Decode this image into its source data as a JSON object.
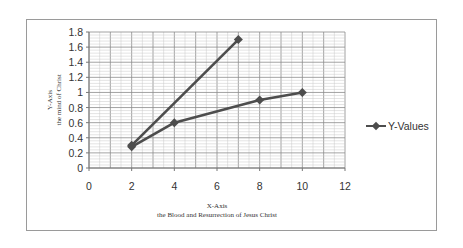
{
  "chart_data": {
    "type": "scatter",
    "title": "",
    "xlabel": "X-Axis\nthe Blood and Resurrection of Jesus Christ",
    "xlabel_lines": [
      "X-Axis",
      "the Blood and Resurrection of Jesus Christ"
    ],
    "ylabel": "Y-Axis\nthe mind of Christ",
    "ylabel_lines": [
      "Y-Axis",
      "the mind of Christ"
    ],
    "xlim": [
      0,
      12
    ],
    "ylim": [
      0,
      1.8
    ],
    "x_ticks": [
      0,
      2,
      4,
      6,
      8,
      10,
      12
    ],
    "y_ticks": [
      0,
      0.2,
      0.4,
      0.6,
      0.8,
      1,
      1.2,
      1.4,
      1.6,
      1.8
    ],
    "grid": true,
    "legend_position": "right",
    "series": [
      {
        "name": "Y-Values",
        "points": [
          [
            2,
            0.3
          ],
          [
            7,
            1.7
          ]
        ]
      },
      {
        "name": "Y-Values",
        "points": [
          [
            2,
            0.28
          ],
          [
            4,
            0.6
          ],
          [
            8,
            0.9
          ],
          [
            10,
            1.0
          ]
        ]
      }
    ],
    "legend": [
      "Y-Values"
    ]
  },
  "colors": {
    "line": "#4d4d4d",
    "grid_major": "#8c8c8c",
    "grid_minor": "#c8c8c8",
    "border": "#9a9a9a"
  }
}
